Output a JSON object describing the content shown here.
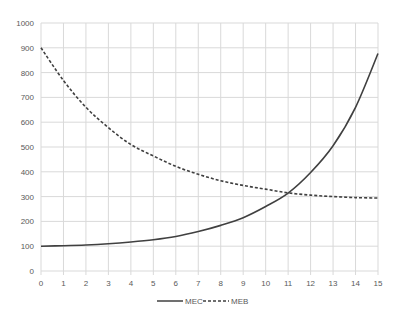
{
  "chart_data": {
    "type": "line",
    "title": "",
    "xlabel": "",
    "ylabel": "",
    "x": [
      0,
      1,
      2,
      3,
      4,
      5,
      6,
      7,
      8,
      9,
      10,
      11,
      12,
      13,
      14,
      15
    ],
    "xlim": [
      0,
      15
    ],
    "ylim": [
      0,
      1000
    ],
    "y_ticks": [
      0,
      100,
      200,
      300,
      400,
      500,
      600,
      700,
      800,
      900,
      1000
    ],
    "x_ticks": [
      0,
      1,
      2,
      3,
      4,
      5,
      6,
      7,
      8,
      9,
      10,
      11,
      12,
      13,
      14,
      15
    ],
    "grid": true,
    "legend_position": "bottom",
    "series": [
      {
        "name": "MEC",
        "style": "solid",
        "color": "#404040",
        "values": [
          100,
          102,
          105,
          110,
          117,
          126,
          139,
          159,
          184,
          215,
          260,
          314,
          397,
          505,
          660,
          877
        ]
      },
      {
        "name": "MEB",
        "style": "dashed",
        "color": "#404040",
        "values": [
          900,
          768,
          660,
          578,
          510,
          464,
          422,
          390,
          364,
          345,
          330,
          315,
          306,
          300,
          296,
          294
        ]
      }
    ]
  },
  "legend": {
    "items": [
      {
        "label": "MEC",
        "style": "solid"
      },
      {
        "label": "MEB",
        "style": "dashed"
      }
    ]
  }
}
